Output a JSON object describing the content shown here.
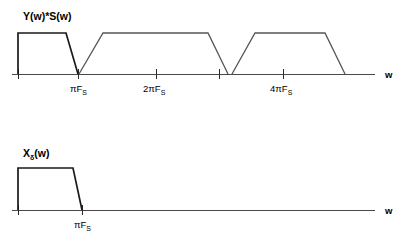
{
  "figure": {
    "title_top": "Y(w)*S(w)",
    "title_bottom": "Xδ(w)",
    "axis_label_top": "w",
    "axis_label_bottom": "w"
  },
  "chart_data": {
    "type": "line",
    "xlabel": "w",
    "ylabel": "",
    "grid": false,
    "legend": false,
    "panels": [
      {
        "name": "top-plot",
        "title": "Y(w)*S(w)",
        "xlabel": "w",
        "xticks": [
          {
            "label": "",
            "sub": "",
            "x_px": 18
          },
          {
            "label": "πF",
            "sub": "S",
            "x_px": 78
          },
          {
            "label": "2πF",
            "sub": "S",
            "x_px": 156
          },
          {
            "label": "",
            "sub": "",
            "x_px": 219
          },
          {
            "label": "4πF",
            "sub": "S",
            "x_px": 283
          }
        ],
        "description": "Three trapezoidal spectral replicas of equal amplitude",
        "series": [
          {
            "name": "replica-0-baseband",
            "points_px": [
              [
                18,
                74
              ],
              [
                18,
                33
              ],
              [
                66,
                33
              ],
              [
                78,
                74
              ]
            ]
          },
          {
            "name": "replica-1",
            "points_px": [
              [
                79,
                74
              ],
              [
                103,
                33
              ],
              [
                208,
                33
              ],
              [
                228,
                74
              ]
            ]
          },
          {
            "name": "replica-2",
            "points_px": [
              [
                232,
                74
              ],
              [
                255,
                33
              ],
              [
                325,
                33
              ],
              [
                345,
                74
              ]
            ]
          }
        ],
        "axis_px": {
          "x_start": 12,
          "x_end": 375,
          "y_baseline": 74
        }
      },
      {
        "name": "bottom-plot",
        "title": "Xδ(w)",
        "xlabel": "w",
        "xticks": [
          {
            "label": "",
            "sub": "",
            "x_px": 18
          },
          {
            "label": "πF",
            "sub": "S",
            "x_px": 82
          }
        ],
        "description": "Single baseband trapezoid, zero beyond pi*Fs",
        "series": [
          {
            "name": "baseband",
            "points_px": [
              [
                18,
                210
              ],
              [
                18,
                168
              ],
              [
                73,
                168
              ],
              [
                82,
                210
              ]
            ]
          }
        ],
        "axis_px": {
          "x_start": 12,
          "x_end": 375,
          "y_baseline": 210
        }
      }
    ]
  }
}
